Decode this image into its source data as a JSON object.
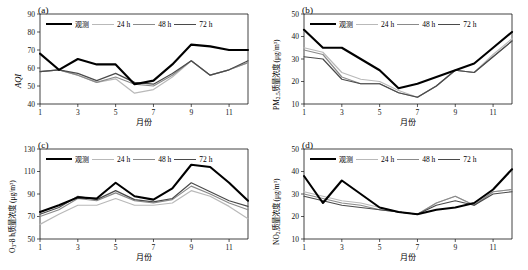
{
  "figure": {
    "title": "",
    "panel_count": 4
  },
  "legend": {
    "entries": [
      {
        "label": "观测",
        "color": "#000000",
        "width": 2.1,
        "key": "obs"
      },
      {
        "label": "24 h",
        "color": "#b9b9b9",
        "width": 1.2,
        "key": "h24"
      },
      {
        "label": "48 h",
        "color": "#8a8a8a",
        "width": 1.2,
        "key": "h48"
      },
      {
        "label": "72 h",
        "color": "#4a4a4a",
        "width": 1.2,
        "key": "h72"
      }
    ]
  },
  "axis": {
    "xlabel": "月份",
    "xticks": [
      "1",
      "3",
      "5",
      "7",
      "9",
      "11"
    ],
    "xtickvals": [
      1,
      3,
      5,
      7,
      9,
      11
    ],
    "xlim": [
      1,
      12
    ]
  },
  "chart_data": [
    {
      "id": "a",
      "tag": "(a)",
      "type": "line",
      "title": "",
      "xlabel": "月份",
      "ylabel": "AQI",
      "ylabel_parts": {
        "main": "AQI",
        "sub": "",
        "unit": ""
      },
      "x": [
        1,
        2,
        3,
        4,
        5,
        6,
        7,
        8,
        9,
        10,
        11,
        12
      ],
      "xlim": [
        1,
        12
      ],
      "ylim": [
        40,
        90
      ],
      "yticks": [
        40,
        50,
        60,
        70,
        80,
        90
      ],
      "grid": false,
      "legend_position": "top-inside",
      "series": [
        {
          "name": "观测",
          "key": "obs",
          "values": [
            68,
            59,
            65,
            62,
            62,
            51,
            53,
            62,
            73,
            72,
            70,
            70
          ]
        },
        {
          "name": "24 h",
          "key": "h24",
          "values": [
            58,
            59,
            56,
            52,
            54,
            46,
            48,
            55,
            64,
            56,
            59,
            63
          ]
        },
        {
          "name": "48 h",
          "key": "h48",
          "values": [
            58,
            59,
            56,
            52,
            55,
            51,
            50,
            56,
            64,
            56,
            59,
            63
          ]
        },
        {
          "name": "72 h",
          "key": "h72",
          "values": [
            58,
            59,
            57,
            53,
            57,
            52,
            51,
            57,
            64,
            56,
            59,
            64
          ]
        }
      ]
    },
    {
      "id": "b",
      "tag": "(b)",
      "type": "line",
      "title": "",
      "xlabel": "月份",
      "ylabel": "PM2.5质量浓度 (μg/m3)",
      "ylabel_parts": {
        "main": "PM",
        "sub": "2.5",
        "rest": "质量浓度",
        "unit": "(μg/m³)"
      },
      "x": [
        1,
        2,
        3,
        4,
        5,
        6,
        7,
        8,
        9,
        10,
        11,
        12
      ],
      "xlim": [
        1,
        12
      ],
      "ylim": [
        10,
        50
      ],
      "yticks": [
        10,
        20,
        30,
        40,
        50
      ],
      "grid": false,
      "legend_position": "top-inside",
      "series": [
        {
          "name": "观测",
          "key": "obs",
          "values": [
            43,
            35,
            35,
            30,
            25,
            17,
            19,
            22,
            25,
            28,
            35,
            42
          ]
        },
        {
          "name": "24 h",
          "key": "h24",
          "values": [
            35,
            33,
            24,
            21,
            20,
            16,
            13,
            18,
            25,
            24,
            32,
            39
          ]
        },
        {
          "name": "48 h",
          "key": "h48",
          "values": [
            34,
            32,
            22,
            19,
            19,
            15,
            13,
            18,
            25,
            24,
            31,
            38
          ]
        },
        {
          "name": "72 h",
          "key": "h72",
          "values": [
            31,
            30,
            21,
            19,
            19,
            15,
            13,
            18,
            25,
            24,
            31,
            38
          ]
        }
      ]
    },
    {
      "id": "c",
      "tag": "(c)",
      "type": "line",
      "title": "",
      "xlabel": "月份",
      "ylabel": "O3-8 h质量浓度 (μg/m3)",
      "ylabel_parts": {
        "main": "O",
        "sub": "3",
        "rest": "-8 h质量浓度",
        "unit": "(μg/m³)"
      },
      "x": [
        1,
        2,
        3,
        4,
        5,
        6,
        7,
        8,
        9,
        10,
        11,
        12
      ],
      "xlim": [
        1,
        12
      ],
      "ylim": [
        50,
        130
      ],
      "yticks": [
        50,
        70,
        90,
        110,
        130
      ],
      "grid": false,
      "legend_position": "top-inside",
      "series": [
        {
          "name": "观测",
          "key": "obs",
          "values": [
            74,
            80,
            87,
            86,
            100,
            88,
            85,
            95,
            116,
            114,
            100,
            84
          ]
        },
        {
          "name": "24 h",
          "key": "h24",
          "values": [
            63,
            72,
            80,
            80,
            86,
            80,
            80,
            82,
            93,
            88,
            79,
            68
          ]
        },
        {
          "name": "48 h",
          "key": "h48",
          "values": [
            70,
            76,
            86,
            84,
            91,
            84,
            82,
            85,
            97,
            90,
            82,
            76
          ]
        },
        {
          "name": "72 h",
          "key": "h72",
          "values": [
            72,
            78,
            88,
            85,
            93,
            85,
            83,
            86,
            100,
            92,
            84,
            79
          ]
        }
      ]
    },
    {
      "id": "d",
      "tag": "(d)",
      "type": "line",
      "title": "",
      "xlabel": "月份",
      "ylabel": "NO2质量浓度 (μg/m3)",
      "ylabel_parts": {
        "main": "NO",
        "sub": "2",
        "rest": "质量浓度",
        "unit": "(μg/m³)"
      },
      "x": [
        1,
        2,
        3,
        4,
        5,
        6,
        7,
        8,
        9,
        10,
        11,
        12
      ],
      "xlim": [
        1,
        12
      ],
      "ylim": [
        10,
        50
      ],
      "yticks": [
        10,
        20,
        30,
        40,
        50
      ],
      "grid": false,
      "legend_position": "top-inside",
      "series": [
        {
          "name": "观测",
          "key": "obs",
          "values": [
            38,
            26,
            36,
            30,
            24,
            22,
            21,
            23,
            24,
            26,
            32,
            41
          ]
        },
        {
          "name": "24 h",
          "key": "h24",
          "values": [
            31,
            29,
            27,
            26,
            24,
            22,
            21,
            26,
            29,
            25,
            31,
            32
          ]
        },
        {
          "name": "48 h",
          "key": "h48",
          "values": [
            30,
            28,
            26,
            25,
            23,
            22,
            21,
            26,
            29,
            25,
            31,
            32
          ]
        },
        {
          "name": "72 h",
          "key": "h72",
          "values": [
            29,
            27,
            25,
            24,
            23,
            22,
            21,
            25,
            27,
            25,
            30,
            31
          ]
        }
      ]
    }
  ]
}
